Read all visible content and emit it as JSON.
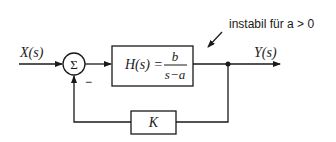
{
  "diagram": {
    "input_label": "X(s)",
    "output_label": "Y(s)",
    "sum_symbol": "Σ",
    "feedback_sign": "−",
    "plant": {
      "lhs": "H(s) =",
      "numerator": "b",
      "denominator": "s−a"
    },
    "feedback_gain": "K",
    "annotation": "instabil für a > 0"
  },
  "colors": {
    "stroke": "#1a1a1a",
    "background": "#ffffff"
  }
}
